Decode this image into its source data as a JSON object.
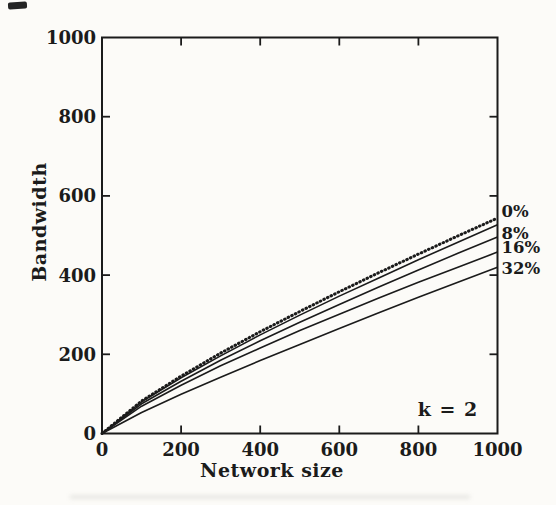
{
  "figure": {
    "ink_color": "#1b1b1b",
    "background_color": "#fcfbf8",
    "annotation": "k = 2"
  },
  "chart_data": {
    "type": "line",
    "title": "",
    "xlabel": "Network size",
    "ylabel": "Bandwidth",
    "xlim": [
      0,
      1000
    ],
    "ylim": [
      0,
      1000
    ],
    "xticks": [
      0,
      200,
      400,
      600,
      800,
      1000
    ],
    "yticks": [
      0,
      200,
      400,
      600,
      800,
      1000
    ],
    "grid": false,
    "legend_position": "right-edge-labels",
    "x": [
      0,
      100,
      200,
      300,
      400,
      500,
      600,
      700,
      800,
      900,
      1000
    ],
    "series": [
      {
        "name": "top-dotted",
        "style": "dotted",
        "label": "",
        "values": [
          0,
          82,
          145,
          203,
          257,
          308,
          358,
          406,
          453,
          499,
          544
        ]
      },
      {
        "name": "0%",
        "style": "solid",
        "label": "0%",
        "label_at": 562,
        "values": [
          0,
          80,
          141,
          196,
          249,
          299,
          347,
          393,
          439,
          483,
          527
        ]
      },
      {
        "name": "8%",
        "style": "solid",
        "label": "8%",
        "label_at": 506,
        "values": [
          0,
          75,
          132,
          185,
          234,
          281,
          326,
          370,
          413,
          455,
          496
        ]
      },
      {
        "name": "16%",
        "style": "solid",
        "label": "16%",
        "label_at": 471,
        "values": [
          0,
          69,
          122,
          171,
          216,
          260,
          301,
          342,
          382,
          420,
          458
        ]
      },
      {
        "name": "32%",
        "style": "solid",
        "label": "32%",
        "label_at": 418,
        "values": [
          0,
          53,
          99,
          142,
          184,
          225,
          265,
          305,
          344,
          382,
          420
        ]
      }
    ],
    "annotations": [
      {
        "text": "k = 2",
        "position": "lower-right-inside"
      }
    ]
  }
}
